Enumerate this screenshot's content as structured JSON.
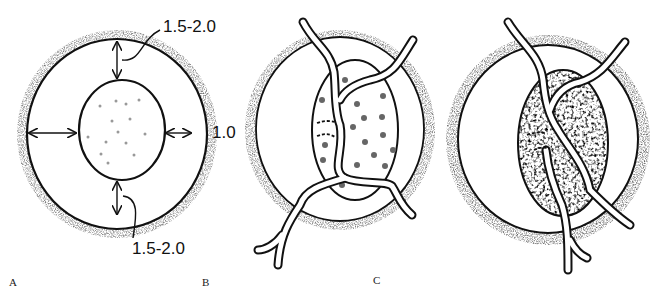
{
  "figure": {
    "panels": [
      {
        "id": "A",
        "label": "A",
        "description": "Ring with inner oval; margin arrows"
      },
      {
        "id": "B",
        "label": "B",
        "description": "Ring with vessels crossing oval, light stipple"
      },
      {
        "id": "C",
        "label": "C",
        "description": "Ring with vessels crossing oval, dense stipple"
      }
    ],
    "measurements": {
      "top": "1.5-2.0",
      "side": "1.0",
      "bottom": "1.5-2.0"
    }
  },
  "colors": {
    "ink": "#111111",
    "background": "#ffffff",
    "stipple": "#555555"
  }
}
